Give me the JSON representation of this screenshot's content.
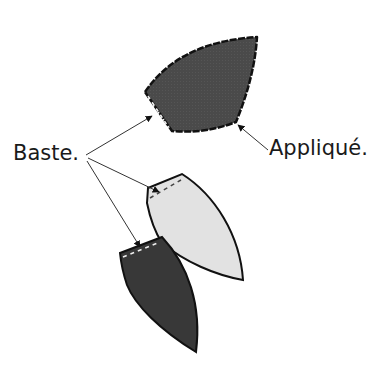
{
  "diagram": {
    "labels": {
      "applique": "Appliqué.",
      "baste": "Baste."
    },
    "colors": {
      "background": "#ffffff",
      "dark_fabric": "#3a3a3a",
      "medium_dark_fabric": "#4a4a4a",
      "light_fabric": "#e2e2e2",
      "outline": "#111111",
      "arrow": "#333333",
      "basting_stitch": "#f0f0f0"
    },
    "shapes": [
      {
        "name": "top-applique-shape",
        "fill": "medium-dark",
        "edge": "dashed applique stitching outline",
        "basted_edge": "left"
      },
      {
        "name": "light-petal-shape",
        "fill": "light",
        "basted_edge": "top"
      },
      {
        "name": "dark-petal-shape",
        "fill": "dark",
        "basted_edge": "top"
      }
    ],
    "arrows": [
      {
        "from": "baste-label",
        "to": "top-applique-shape basted edge"
      },
      {
        "from": "baste-label",
        "to": "light-petal-shape basted edge"
      },
      {
        "from": "baste-label",
        "to": "dark-petal-shape basted edge"
      },
      {
        "from": "applique-label",
        "to": "top-applique-shape stitched edge"
      }
    ]
  }
}
